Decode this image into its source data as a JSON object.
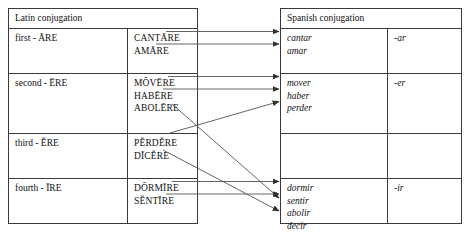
{
  "diagram": {
    "title_latin": "Latin conjugation",
    "title_spanish": "Spanish conjugation",
    "line_color": "#55554f",
    "border_color": "#3a3a3a"
  },
  "latin": {
    "header": "Latin conjugation",
    "rows": [
      {
        "label": "first - ĀRE",
        "verbs": [
          "CANTĀRE",
          "AMĀRE"
        ]
      },
      {
        "label": "second - ĒRE",
        "verbs": [
          "MŎVĒRE",
          "HABĒRE",
          "ABOLĒRE"
        ]
      },
      {
        "label": "third - ĔRE",
        "verbs": [
          "PĔRDĔRE",
          "DĪCĔRE"
        ]
      },
      {
        "label": "fourth - ĪRE",
        "verbs": [
          "DŎRMĪRE",
          "SĔNTĪRE"
        ]
      }
    ]
  },
  "spanish": {
    "header": "Spanish conjugation",
    "rows": [
      {
        "verbs": [
          "cantar",
          "amar"
        ],
        "suffix": "-ar"
      },
      {
        "verbs": [
          "mover",
          "haber",
          "perder"
        ],
        "suffix": "-er"
      },
      {
        "verbs": [],
        "suffix": ""
      },
      {
        "verbs": [
          "dormir",
          "sentir",
          "abolir",
          "decir"
        ],
        "suffix": "-ir"
      }
    ]
  },
  "mappings": [
    {
      "from": "CANTĀRE",
      "to": "cantar",
      "type": "straight"
    },
    {
      "from": "AMĀRE",
      "to": "amar",
      "type": "straight"
    },
    {
      "from": "MŎVĒRE",
      "to": "mover",
      "type": "straight"
    },
    {
      "from": "HABĒRE",
      "to": "haber",
      "type": "straight"
    },
    {
      "from": "ABOLĒRE",
      "to": "abolir",
      "type": "crossing"
    },
    {
      "from": "PĔRDĔRE",
      "to": "perder",
      "type": "crossing"
    },
    {
      "from": "DĪCĔRE",
      "to": "decir",
      "type": "crossing"
    },
    {
      "from": "DŎRMĪRE",
      "to": "dormir",
      "type": "straight"
    },
    {
      "from": "SĔNTĪRE",
      "to": "sentir",
      "type": "straight"
    }
  ]
}
